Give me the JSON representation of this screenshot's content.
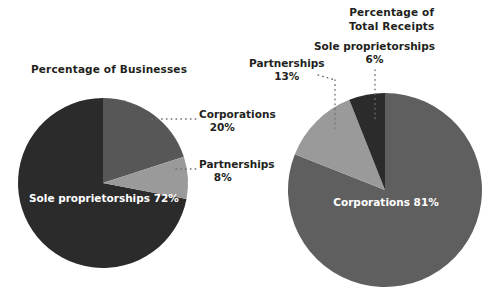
{
  "chart_data": [
    {
      "type": "pie",
      "title": "Percentage of Businesses",
      "id": "businesses",
      "unit": "%",
      "center": [
        103,
        183
      ],
      "radius": 85,
      "slices": [
        {
          "label": "Corporations",
          "value": 20,
          "value_label": "20%",
          "color": "#575757",
          "label_position": "outside-right"
        },
        {
          "label": "Partnerships",
          "value": 8,
          "value_label": "8%",
          "color": "#9a9a9a",
          "label_position": "outside-right"
        },
        {
          "label": "Sole proprietorships",
          "value": 72,
          "value_label": "72%",
          "color": "#2b2b2b",
          "label_position": "inside"
        }
      ]
    },
    {
      "type": "pie",
      "title": "Percentage of Total Receipts",
      "id": "receipts",
      "unit": "%",
      "center": [
        385,
        190
      ],
      "radius": 97,
      "slices": [
        {
          "label": "Corporations",
          "value": 81,
          "value_label": "81%",
          "color": "#5f5f5f",
          "label_position": "inside"
        },
        {
          "label": "Partnerships",
          "value": 13,
          "value_label": "13%",
          "color": "#9a9a9a",
          "label_position": "outside-top"
        },
        {
          "label": "Sole proprietorships",
          "value": 6,
          "value_label": "6%",
          "color": "#2b2b2b",
          "label_position": "outside-top"
        }
      ]
    }
  ],
  "left_chart": {
    "title": "Percentage of Businesses",
    "corporations": {
      "name": "Corporations",
      "pct": "20%"
    },
    "partnerships": {
      "name": "Partnerships",
      "pct": "8%"
    },
    "sole": {
      "name": "Sole proprietorships",
      "pct": "72%"
    }
  },
  "right_chart": {
    "title_line1": "Percentage of",
    "title_line2": "Total Receipts",
    "corporations": {
      "name": "Corporations",
      "pct": "81%"
    },
    "partnerships": {
      "name": "Partnerships",
      "pct": "13%"
    },
    "sole": {
      "name": "Sole proprietorships",
      "pct": "6%"
    }
  },
  "colors": {
    "dark": "#2b2b2b",
    "mid": "#575757",
    "mid_right": "#5f5f5f",
    "light": "#9a9a9a",
    "text": "#231f20",
    "label_on_slice": "#ffffff",
    "leader": "#6f6f6f",
    "background": "#ffffff"
  }
}
